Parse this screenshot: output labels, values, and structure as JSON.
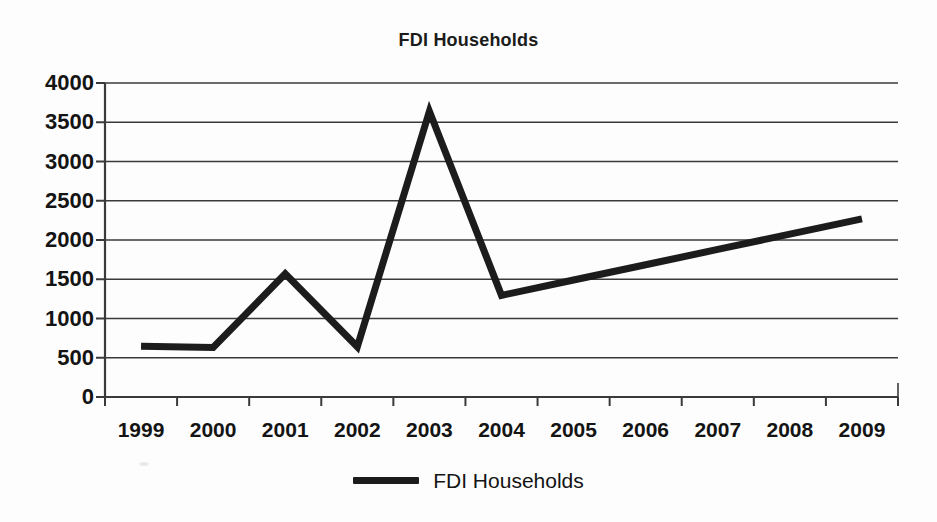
{
  "chart_data": {
    "type": "line",
    "title": "FDI Households",
    "xlabel": "",
    "ylabel": "",
    "categories": [
      "1999",
      "2000",
      "2001",
      "2002",
      "2003",
      "2004",
      "2005",
      "2006",
      "2007",
      "2008",
      "2009"
    ],
    "series": [
      {
        "name": "FDI Households",
        "values": [
          645,
          630,
          1570,
          640,
          3640,
          1295,
          1490,
          1685,
          1880,
          2075,
          2270
        ],
        "color": "#1c1c1c"
      }
    ],
    "ylim": [
      0,
      4000
    ],
    "yticks": [
      0,
      500,
      1000,
      1500,
      2000,
      2500,
      3000,
      3500,
      4000
    ],
    "ytick_labels": [
      "0",
      "500",
      "1000",
      "1500",
      "2000",
      "2500",
      "3000",
      "3500",
      "4000"
    ],
    "grid": "horizontal",
    "legend_position": "bottom",
    "legend_entries": [
      "FDI Households"
    ]
  },
  "style": {
    "background": "#fdfdfd",
    "axis_color": "#3a3a3a",
    "grid_color": "#3a3a3a",
    "text_color": "#141414",
    "line_color": "#1c1c1c"
  }
}
